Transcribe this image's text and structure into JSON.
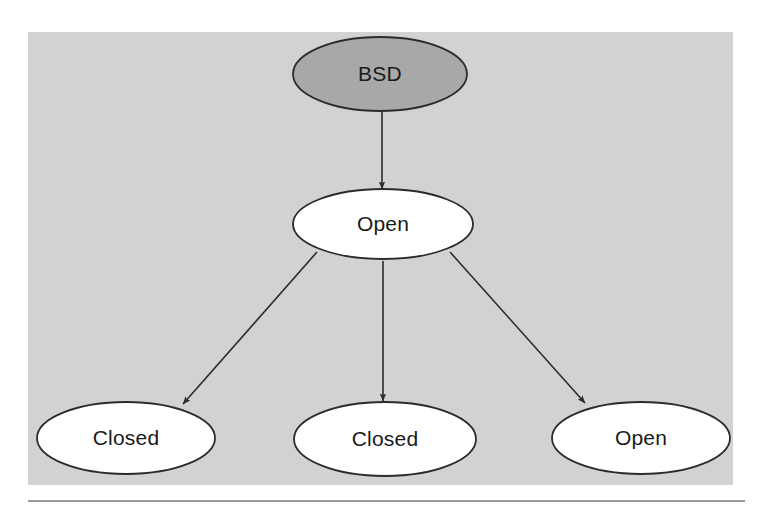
{
  "figure": {
    "background_color": "#ffffff",
    "panel_color": "#d2d2d2",
    "panel": {
      "x": 28,
      "y": 32,
      "width": 705,
      "height": 453
    },
    "rule": {
      "color": "#9a9a9a",
      "x1": 28,
      "y1": 501,
      "x2": 745,
      "y2": 501,
      "thickness": 2
    }
  },
  "diagram_data": {
    "type": "diagram",
    "layout": "tree",
    "orientation": "top-down",
    "stroke_color": "#2b2b2b",
    "nodes": [
      {
        "id": "bsd",
        "label": "BSD",
        "shape": "ellipse",
        "cx": 380,
        "cy": 74,
        "rx": 87,
        "ry": 37,
        "fill": "#a8a8a8",
        "stroke": "#2b2b2b",
        "level": 0
      },
      {
        "id": "open-root",
        "label": "Open",
        "shape": "ellipse",
        "cx": 383,
        "cy": 224,
        "rx": 90,
        "ry": 35,
        "fill": "#ffffff",
        "stroke": "#2b2b2b",
        "level": 1
      },
      {
        "id": "closed-left",
        "label": "Closed",
        "shape": "ellipse",
        "cx": 126,
        "cy": 438,
        "rx": 89,
        "ry": 36,
        "fill": "#ffffff",
        "stroke": "#2b2b2b",
        "level": 2
      },
      {
        "id": "closed-middle",
        "label": "Closed",
        "shape": "ellipse",
        "cx": 385,
        "cy": 439,
        "rx": 91,
        "ry": 37,
        "fill": "#ffffff",
        "stroke": "#2b2b2b",
        "level": 2
      },
      {
        "id": "open-right",
        "label": "Open",
        "shape": "ellipse",
        "cx": 641,
        "cy": 438,
        "rx": 89,
        "ry": 36,
        "fill": "#ffffff",
        "stroke": "#2b2b2b",
        "level": 2
      }
    ],
    "edges": [
      {
        "id": "edge-bsd-open",
        "from": "bsd",
        "to": "open-root",
        "label": "",
        "arrow": true,
        "x1": 382,
        "y1": 112,
        "x2": 382,
        "y2": 189
      },
      {
        "id": "edge-open-closed-left",
        "from": "open-root",
        "to": "closed-left",
        "label": "",
        "arrow": true,
        "x1": 317,
        "y1": 252,
        "x2": 183,
        "y2": 404
      },
      {
        "id": "edge-open-closed-middle",
        "from": "open-root",
        "to": "closed-middle",
        "label": "",
        "arrow": true,
        "x1": 383,
        "y1": 261,
        "x2": 383,
        "y2": 401
      },
      {
        "id": "edge-open-open-right",
        "from": "open-root",
        "to": "open-right",
        "label": "",
        "arrow": true,
        "x1": 450,
        "y1": 252,
        "x2": 585,
        "y2": 403
      }
    ]
  }
}
